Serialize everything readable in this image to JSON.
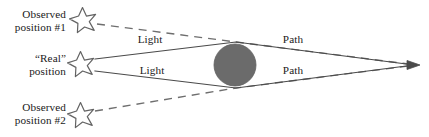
{
  "diagram": {
    "type": "gravitational-lensing-schematic",
    "background_color": "#ffffff",
    "line_color": "#4a4a4a",
    "mass_color": "#6b6b6b",
    "text_color": "#1a1a1a",
    "labels": {
      "observed_position_1_line1": "Observed",
      "observed_position_1_line2": "position #1",
      "real_position_line1": "“Real”",
      "real_position_line2": "position",
      "observed_position_2_line1": "Observed",
      "observed_position_2_line2": "position #2",
      "light_upper": "Light",
      "light_lower": "Light",
      "path_upper": "Path",
      "path_lower": "Path"
    },
    "elements": {
      "star_observed_1": {
        "cx": 82,
        "cy": 20,
        "r": 13
      },
      "star_real": {
        "cx": 80,
        "cy": 64,
        "r": 13
      },
      "star_observed_2": {
        "cx": 80,
        "cy": 115,
        "r": 13
      },
      "mass_circle": {
        "cx": 235,
        "cy": 65,
        "r": 21
      },
      "observer_point": {
        "x": 416,
        "y": 65
      },
      "upper_ray_vertex": {
        "x": 236,
        "y": 42
      },
      "lower_ray_vertex": {
        "x": 236,
        "y": 88
      }
    }
  }
}
